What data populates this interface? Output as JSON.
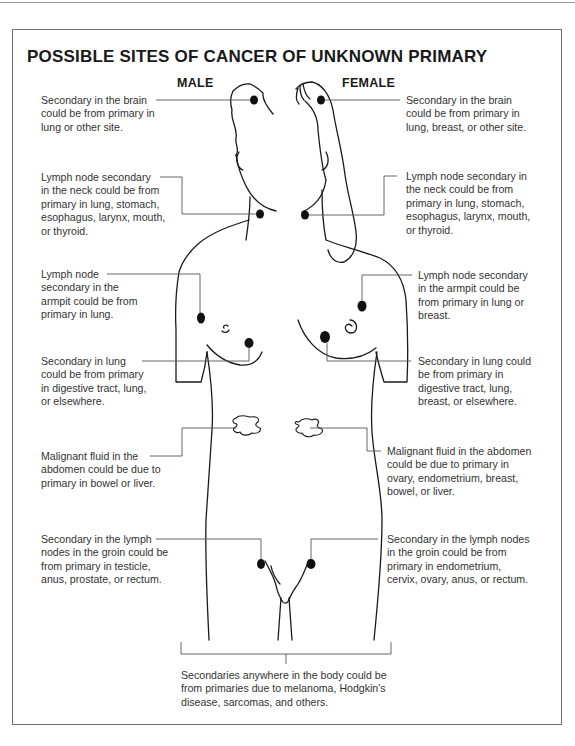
{
  "title": "POSSIBLE SITES OF CANCER OF UNKNOWN PRIMARY",
  "columns": {
    "male": "MALE",
    "female": "FEMALE"
  },
  "male_labels": [
    {
      "id": "brain",
      "text": "Secondary in the brain\ncould be from primary in\nlung or other site."
    },
    {
      "id": "neck",
      "text": "Lymph node secondary\nin the neck could be from\nprimary in lung, stomach,\nesophagus, larynx, mouth,\nor thyroid."
    },
    {
      "id": "armpit",
      "text": "Lymph node\nsecondary in the\narmpit could be from\nprimary in lung."
    },
    {
      "id": "lung",
      "text": "Secondary in lung\ncould be from primary\nin digestive tract, lung,\nor elsewhere."
    },
    {
      "id": "abdomen",
      "text": "Malignant fluid in the\nabdomen could be due to\nprimary in bowel or liver."
    },
    {
      "id": "groin",
      "text": "Secondary in the lymph\nnodes in the groin could be\nfrom primary in testicle,\nanus, prostate, or rectum."
    }
  ],
  "female_labels": [
    {
      "id": "brain",
      "text": "Secondary in the brain\ncould be from primary in\nlung, breast, or other site."
    },
    {
      "id": "neck",
      "text": "Lymph node secondary in\nthe neck could be from\nprimary in lung, stomach,\nesophagus, larynx, mouth,\nor thyroid."
    },
    {
      "id": "armpit",
      "text": "Lymph node secondary\nin the armpit could be\nfrom primary in lung or\nbreast."
    },
    {
      "id": "lung",
      "text": "Secondary in lung could\nbe from primary in\ndigestive tract, lung,\nbreast, or elsewhere."
    },
    {
      "id": "abdomen",
      "text": "Malignant fluid in the abdomen\ncould be due to primary in\novary, endometrium, breast,\nbowel, or liver."
    },
    {
      "id": "groin",
      "text": "Secondary in the lymph nodes\nin the groin could be from\nprimary in endometrium,\ncervix, ovary, anus, or rectum."
    }
  ],
  "footer_note": "Secondaries anywhere in the body could be\nfrom primaries due to melanoma, Hodgkin's\ndisease, sarcomas, and others.",
  "colors": {
    "ink": "#1a1a1a",
    "leader": "#555555",
    "frame": "#6e6e6e"
  }
}
